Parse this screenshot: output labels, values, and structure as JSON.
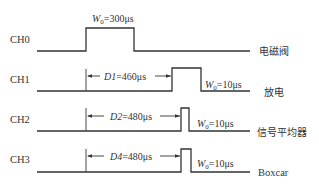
{
  "channels": [
    {
      "name": "CH0",
      "right_label": "电磁阀",
      "baseline_y": 51,
      "high_y": 28,
      "pulse_start_x": 86,
      "pulse_end_x": 134,
      "width_label_var": "W",
      "width_label_sub": "0",
      "width_label_val": "=300μs"
    },
    {
      "name": "CH1",
      "right_label": "放电",
      "baseline_y": 91,
      "high_y": 68,
      "pulse_start_x": 172,
      "pulse_end_x": 201,
      "delay_var": "D1",
      "delay_val": "=460μs",
      "width_label_var": "W",
      "width_label_sub": "0",
      "width_label_val": "=10μs"
    },
    {
      "name": "CH2",
      "right_label": "信号平均器",
      "baseline_y": 131,
      "high_y": 108,
      "pulse_start_x": 181,
      "pulse_end_x": 189,
      "delay_var": "D2",
      "delay_val": "=480μs",
      "width_label_var": "W",
      "width_label_sub": "0",
      "width_label_val": "=10μs"
    },
    {
      "name": "CH3",
      "right_label": "Boxcar",
      "baseline_y": 172,
      "high_y": 149,
      "pulse_start_x": 181,
      "pulse_end_x": 191,
      "delay_var": "D4",
      "delay_val": "=480μs",
      "width_label_var": "W",
      "width_label_sub": "0",
      "width_label_val": "=10μs"
    }
  ],
  "line_start_x": 37,
  "line_end_x": 250,
  "reference_x": 86
}
